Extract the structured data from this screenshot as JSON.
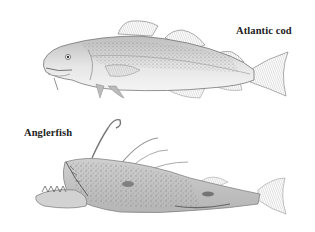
{
  "figure": {
    "background": "#ffffff",
    "illustration_style": "engraving",
    "ink_color": "#555555",
    "items": [
      {
        "name": "Atlantic cod",
        "label": "Atlantic cod"
      },
      {
        "name": "Anglerfish",
        "label": "Anglerfish"
      }
    ]
  }
}
